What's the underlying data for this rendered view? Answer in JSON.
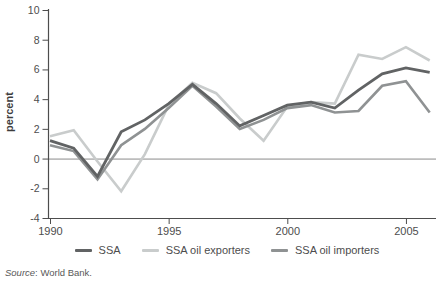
{
  "chart_data": {
    "type": "line",
    "title": "",
    "xlabel": "",
    "ylabel": "percent",
    "ylim": [
      -4,
      10
    ],
    "yticks": [
      10,
      8,
      6,
      4,
      2,
      0,
      -2,
      -4
    ],
    "xticks": [
      1990,
      1995,
      2000,
      2005
    ],
    "zero_line": true,
    "grid": false,
    "legend_position": "bottom",
    "x": [
      1990,
      1991,
      1992,
      1993,
      1994,
      1995,
      1996,
      1997,
      1998,
      1999,
      2000,
      2001,
      2002,
      2003,
      2004,
      2005,
      2006
    ],
    "series": [
      {
        "name": "SSA",
        "color": "#616364",
        "stroke_width": 2.8,
        "values": [
          1.2,
          0.7,
          -1.2,
          1.8,
          2.6,
          3.7,
          5.0,
          3.7,
          2.2,
          2.9,
          3.6,
          3.8,
          3.4,
          4.6,
          5.7,
          6.1,
          5.8
        ]
      },
      {
        "name": "SSA oil exporters",
        "color": "#c9cccc",
        "stroke_width": 2.6,
        "values": [
          1.5,
          1.9,
          -0.2,
          -2.2,
          0.3,
          3.6,
          5.1,
          4.4,
          2.7,
          1.2,
          3.5,
          3.8,
          3.7,
          7.0,
          6.7,
          7.5,
          6.6
        ]
      },
      {
        "name": "SSA oil importers",
        "color": "#8f9293",
        "stroke_width": 2.6,
        "values": [
          0.9,
          0.5,
          -1.4,
          0.9,
          2.0,
          3.4,
          4.9,
          3.5,
          2.0,
          2.6,
          3.4,
          3.6,
          3.1,
          3.2,
          4.9,
          5.2,
          3.1
        ]
      }
    ]
  },
  "axis": {
    "color": "#4d4d4d",
    "zero_line_color": "#8a8a8a"
  },
  "source": {
    "prefix": "Source",
    "text": ": World Bank."
  }
}
